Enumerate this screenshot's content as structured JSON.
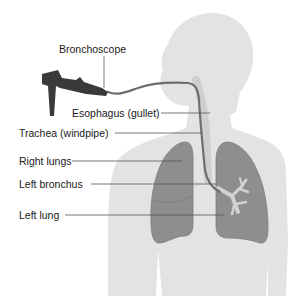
{
  "diagram": {
    "labels": {
      "bronchoscope": "Bronchoscope",
      "esophagus": "Esophagus (gullet)",
      "trachea": "Trachea (windpipe)",
      "right_lungs": "Right lungs",
      "left_bronchus": "Left bronchus",
      "left_lung": "Left lung"
    },
    "colors": {
      "body": "#e3e3e3",
      "lung": "#8e8e8e",
      "lung_edge": "#7a7a7a",
      "scope": "#3a3a3a",
      "tube": "#6e6e6e",
      "bronchus": "#d0d0d0",
      "leader_line": "#555555"
    }
  }
}
